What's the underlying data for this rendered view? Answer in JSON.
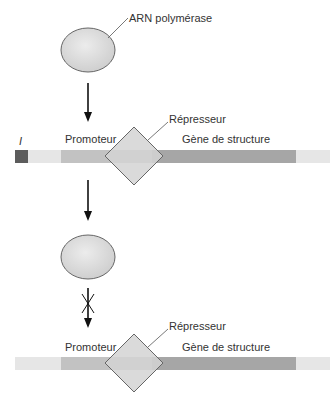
{
  "diagram": {
    "top": {
      "polymerase_label": "ARN polymérase",
      "repressor_label": "Répresseur",
      "promoter_label": "Promoteur",
      "structural_gene_label": "Gène de structure",
      "regulator_gene_label": "I"
    },
    "bottom": {
      "repressor_label": "Répresseur",
      "promoter_label": "Promoteur",
      "structural_gene_label": "Gène de structure"
    },
    "colors": {
      "polymerase_fill": "#dcdcdc",
      "dna_light": "#e6e6e6",
      "promoter": "#c2c2c2",
      "structural_gene": "#a6a6a6",
      "regulator_gene": "#5c5c5c",
      "repressor_fill": "#d4d4d4",
      "stroke": "#555555"
    }
  }
}
